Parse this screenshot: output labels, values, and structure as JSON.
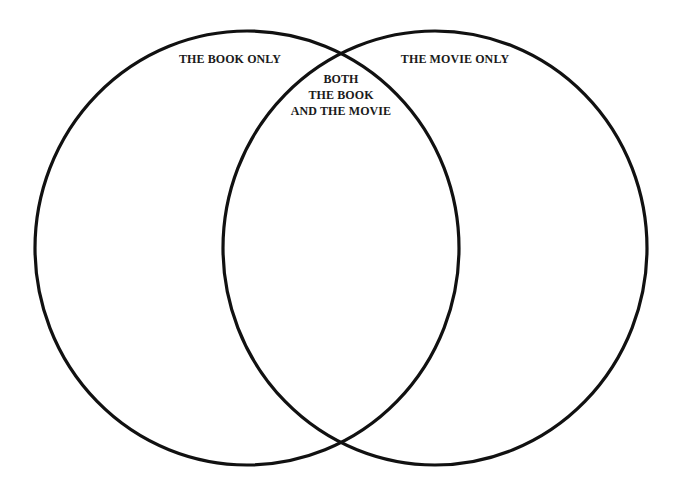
{
  "diagram": {
    "type": "venn",
    "sets": [
      {
        "id": "book",
        "label": "THE BOOK ONLY"
      },
      {
        "id": "movie",
        "label": "THE MOVIE ONLY"
      }
    ],
    "intersection": {
      "lines": [
        "BOTH",
        "THE BOOK",
        "AND THE MOVIE"
      ]
    },
    "colors": {
      "stroke": "#111111",
      "background": "#ffffff",
      "text": "#1a1a1a"
    }
  }
}
